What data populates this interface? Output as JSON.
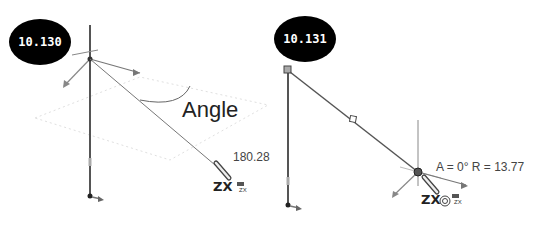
{
  "figures": [
    {
      "id": "left",
      "badge": "10.130",
      "annotation": "Angle",
      "dimension": "180.28",
      "plane_label": "ZX",
      "plane_icon_label": "ZX"
    },
    {
      "id": "right",
      "badge": "10.131",
      "readout": "A = 0° R = 13.77",
      "plane_label": "ZX",
      "plane_icon_label": "ZX"
    }
  ],
  "colors": {
    "badge_bg": "#000000",
    "badge_text": "#ffffff",
    "line": "#555555",
    "axis_arrow": "#777777",
    "plane_dotted": "#dddddd"
  }
}
